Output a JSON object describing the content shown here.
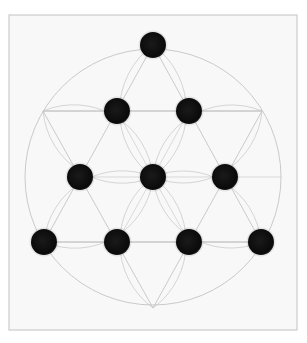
{
  "image": {
    "description": "Pencil drawing of a Tetractys: ten black dots arranged in a triangle (1-2-3-4) overlaid on a hexagram inscribed in a circle, with flower-of-life style petal arcs through the center",
    "colors": {
      "background": "#ffffff",
      "paper": "#f8f8f8",
      "frame_border": "#cccccc",
      "pencil_line": "#c4c4c4",
      "dot": "#0a0a0a"
    },
    "frame": {
      "x": 9,
      "y": 15,
      "width": 288,
      "height": 315
    },
    "circle": {
      "cx": 153,
      "cy": 177,
      "r": 128
    },
    "hexagram": {
      "up_triangle": [
        [
          153,
          45
        ],
        [
          44,
          242
        ],
        [
          261,
          242
        ]
      ],
      "down_triangle": [
        [
          43,
          111
        ],
        [
          262,
          111
        ],
        [
          153,
          308
        ]
      ]
    },
    "dot_radius": 13,
    "dots": [
      {
        "row": 1,
        "cx": 153,
        "cy": 45
      },
      {
        "row": 2,
        "cx": 117,
        "cy": 111
      },
      {
        "row": 2,
        "cx": 189,
        "cy": 111
      },
      {
        "row": 3,
        "cx": 80,
        "cy": 177
      },
      {
        "row": 3,
        "cx": 153,
        "cy": 177
      },
      {
        "row": 3,
        "cx": 225,
        "cy": 177
      },
      {
        "row": 4,
        "cx": 44,
        "cy": 242
      },
      {
        "row": 4,
        "cx": 117,
        "cy": 242
      },
      {
        "row": 4,
        "cx": 189,
        "cy": 242
      },
      {
        "row": 4,
        "cx": 261,
        "cy": 242
      }
    ]
  }
}
